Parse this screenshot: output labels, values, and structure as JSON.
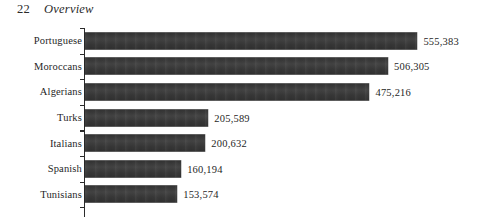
{
  "running_head": {
    "folio": "22",
    "title": "Overview"
  },
  "chart_data": {
    "type": "bar",
    "orientation": "horizontal",
    "title": "",
    "xlabel": "",
    "ylabel": "",
    "categories": [
      "Portuguese",
      "Moroccans",
      "Algerians",
      "Turks",
      "Italians",
      "Spanish",
      "Tunisians"
    ],
    "values": [
      555383,
      506305,
      475216,
      205589,
      200632,
      160194,
      153574
    ],
    "value_labels": [
      "555,383",
      "506,305",
      "475,216",
      "205,589",
      "200,632",
      "160,194",
      "153,574"
    ],
    "xlim": [
      0,
      555383
    ],
    "grid": false,
    "legend": false,
    "bar_color": "#3a3a3a",
    "axis_color": "#2b2b2b",
    "background": "#ffffff"
  }
}
